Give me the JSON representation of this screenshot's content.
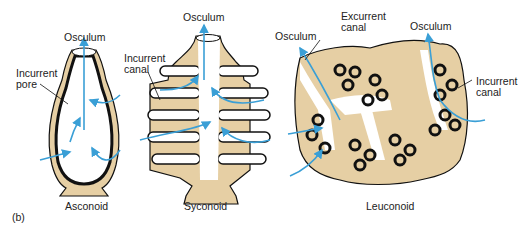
{
  "figure_label": "(b)",
  "colors": {
    "tissue": "#e6cfa4",
    "outline": "#111111",
    "arrow": "#3a9fd6",
    "background": "#ffffff"
  },
  "panels": [
    {
      "name": "Asconoid",
      "labels": {
        "osculum": "Osculum",
        "pore": "Incurrent\npore"
      }
    },
    {
      "name": "Syconoid",
      "labels": {
        "osculum": "Osculum",
        "canal": "Incurrent\ncanal"
      }
    },
    {
      "name": "Leuconoid",
      "labels": {
        "osculum_left": "Osculum",
        "excurrent": "Excurrent\ncanal",
        "osculum_right": "Osculum",
        "incurrent": "Incurrent\ncanal"
      }
    }
  ]
}
